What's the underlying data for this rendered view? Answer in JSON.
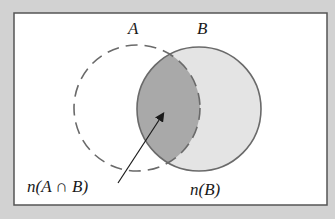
{
  "diagram": {
    "type": "venn",
    "sets": [
      {
        "id": "A",
        "label": "A",
        "outline": "dashed",
        "fill": "none"
      },
      {
        "id": "B",
        "label": "B",
        "outline": "solid",
        "fill": "#e4e4e4"
      }
    ],
    "intersection": {
      "fill": "#a9a9a9"
    },
    "annotations": {
      "intersection_label": "n(A ∩ B)",
      "b_label": "n(B)"
    },
    "colors": {
      "page_background": "#d2d2d2",
      "panel_background": "#ffffff",
      "panel_border": "#555555",
      "circle_stroke": "#6a6a6a",
      "b_fill": "#e4e4e4",
      "intersection_fill": "#a9a9a9"
    }
  }
}
